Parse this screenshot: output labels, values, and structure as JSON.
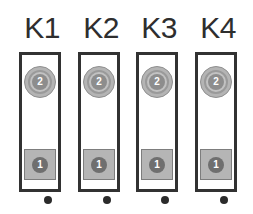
{
  "diagram": {
    "background_color": "#ffffff",
    "outline_color": "#323232",
    "terminal_fill_color": "#b4b4b4",
    "contact_color": "#6f6f6f",
    "pin_color": "#2b2b2b",
    "blocks": [
      {
        "label": "K1",
        "x": 18,
        "terminals": [
          {
            "number": "2",
            "shape": "circle",
            "position": "top"
          },
          {
            "number": "1",
            "shape": "square",
            "position": "bottom"
          }
        ],
        "pin": "dot"
      },
      {
        "label": "K2",
        "x": 77,
        "terminals": [
          {
            "number": "2",
            "shape": "circle",
            "position": "top"
          },
          {
            "number": "1",
            "shape": "square",
            "position": "bottom"
          }
        ],
        "pin": "dot"
      },
      {
        "label": "K3",
        "x": 135,
        "terminals": [
          {
            "number": "2",
            "shape": "circle",
            "position": "top"
          },
          {
            "number": "1",
            "shape": "square",
            "position": "bottom"
          }
        ],
        "pin": "dot"
      },
      {
        "label": "K4",
        "x": 194,
        "terminals": [
          {
            "number": "2",
            "shape": "circle",
            "position": "top"
          },
          {
            "number": "1",
            "shape": "square",
            "position": "bottom"
          }
        ],
        "pin": "dot"
      }
    ]
  }
}
